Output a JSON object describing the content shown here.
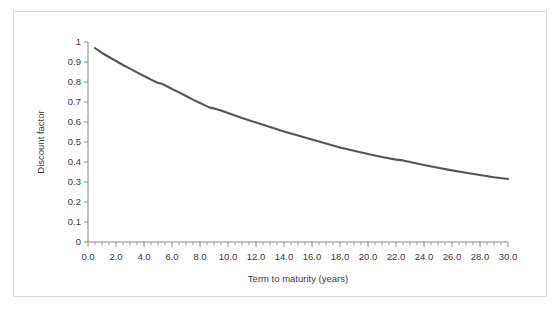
{
  "chart_data": {
    "type": "line",
    "title": "",
    "subtitle": "",
    "xlabel": "Term to maturity (years)",
    "ylabel": "Discount factor",
    "xlim": [
      0.0,
      30.0
    ],
    "ylim": [
      0.0,
      1.0
    ],
    "xticks": [
      0.0,
      2.0,
      4.0,
      6.0,
      8.0,
      10.0,
      12.0,
      14.0,
      16.0,
      18.0,
      20.0,
      22.0,
      24.0,
      26.0,
      28.0,
      30.0
    ],
    "xticklabels": [
      "0.0",
      "2.0",
      "4.0",
      "6.0",
      "8.0",
      "10.0",
      "12.0",
      "14.0",
      "16.0",
      "18.0",
      "20.0",
      "22.0",
      "24.0",
      "26.0",
      "28.0",
      "30.0"
    ],
    "yticks": [
      0.0,
      0.1,
      0.2,
      0.3,
      0.4,
      0.5,
      0.6,
      0.7,
      0.8,
      0.9,
      1.0
    ],
    "yticklabels": [
      "0",
      "0.1",
      "0.2",
      "0.3",
      "0.4",
      "0.5",
      "0.6",
      "0.7",
      "0.8",
      "0.9",
      "1"
    ],
    "xminor_step": 0.5,
    "grid": false,
    "legend": false,
    "legend_position": "none",
    "line_color": "#555555",
    "line_width": 2.1,
    "axis_color": "#8c8c8c",
    "border_color": "#d8d8d8",
    "background_color": "#ffffff",
    "series": [
      {
        "name": "Discount factor",
        "x": [
          0.5,
          1.0,
          1.5,
          2.0,
          2.5,
          3.0,
          3.5,
          4.0,
          4.5,
          5.0,
          5.2,
          5.6,
          6.0,
          6.5,
          7.0,
          7.5,
          8.0,
          8.4,
          8.7,
          9.0,
          9.5,
          10.0,
          11.0,
          12.0,
          13.0,
          14.0,
          15.0,
          16.0,
          17.0,
          18.0,
          19.0,
          20.0,
          21.0,
          22.0,
          22.5,
          23.0,
          24.0,
          25.0,
          26.0,
          27.0,
          28.0,
          29.0,
          30.0
        ],
        "y": [
          0.97,
          0.945,
          0.925,
          0.905,
          0.885,
          0.867,
          0.848,
          0.83,
          0.812,
          0.795,
          0.793,
          0.78,
          0.765,
          0.748,
          0.73,
          0.712,
          0.695,
          0.682,
          0.672,
          0.668,
          0.657,
          0.645,
          0.62,
          0.597,
          0.575,
          0.553,
          0.532,
          0.512,
          0.492,
          0.473,
          0.456,
          0.44,
          0.425,
          0.412,
          0.408,
          0.4,
          0.385,
          0.371,
          0.358,
          0.346,
          0.335,
          0.324,
          0.315
        ]
      }
    ]
  }
}
